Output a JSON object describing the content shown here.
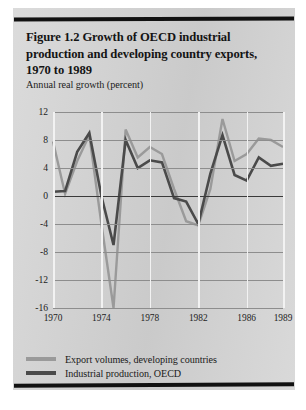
{
  "page": {
    "figure_title": "Figure 1.2  Growth of OECD industrial production and developing country exports, 1970 to 1989",
    "background_color": "#d5d5d5",
    "rule_color": "#111111"
  },
  "chart_data": {
    "type": "line",
    "title": "Figure 1.2  Growth of OECD industrial production and developing country exports, 1970 to 1989",
    "subtitle": "",
    "ylabel": "Annual real growth (percent)",
    "xlabel": "",
    "ylim": [
      -16,
      12
    ],
    "yticks": [
      12,
      8,
      4,
      0,
      -4,
      -8,
      -12,
      -16
    ],
    "ytick_labels": [
      "12",
      "8",
      "4",
      "0",
      "-4",
      "-8",
      "-12",
      "-16"
    ],
    "xlim": [
      1970,
      1989
    ],
    "xticks": [
      1970,
      1974,
      1978,
      1982,
      1986,
      1989
    ],
    "xtick_labels": [
      "1970",
      "1974",
      "1978",
      "1982",
      "1986",
      "1989"
    ],
    "grid": true,
    "grid_color": "#8d8d8d",
    "vgrid_color": "#f2f2f2",
    "zero_line": true,
    "legend_position": "below",
    "x": [
      1970,
      1971,
      1972,
      1973,
      1974,
      1975,
      1976,
      1977,
      1978,
      1979,
      1980,
      1981,
      1982,
      1983,
      1984,
      1985,
      1986,
      1987,
      1988,
      1989
    ],
    "series": [
      {
        "name": "Export volumes, developing countries",
        "color": "#9a9a9a",
        "values": [
          7.8,
          0.3,
          5.0,
          8.7,
          -4.0,
          -16.0,
          9.5,
          5.5,
          7.0,
          6.0,
          1.0,
          -3.6,
          -4.2,
          1.0,
          11.0,
          5.0,
          6.0,
          8.2,
          8.0,
          7.0
        ]
      },
      {
        "name": "Industrial production, OECD",
        "color": "#4a4a4a",
        "values": [
          0.6,
          0.7,
          6.3,
          9.0,
          0.0,
          -7.0,
          8.0,
          4.0,
          5.1,
          4.8,
          -0.3,
          -0.8,
          -4.0,
          3.2,
          8.7,
          3.0,
          2.2,
          5.5,
          4.3,
          4.6
        ]
      }
    ]
  },
  "legend": {
    "items": [
      {
        "label": "Export volumes, developing countries",
        "swatch": "exports"
      },
      {
        "label": "Industrial production, OECD",
        "swatch": "oecd"
      }
    ]
  }
}
